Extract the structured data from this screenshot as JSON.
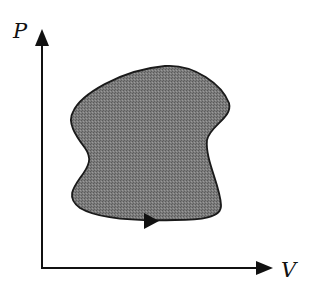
{
  "diagram": {
    "type": "pv-cycle",
    "axes": {
      "y_label": "P",
      "x_label": "V"
    },
    "cycle": {
      "direction": "clockwise",
      "direction_arrow": "right-pointing arrow on bottom edge",
      "fill": "shaded gray region enclosed by closed loop"
    },
    "colors": {
      "axis": "#111111",
      "outline": "#1a1a1a",
      "fill": "#767676"
    }
  }
}
